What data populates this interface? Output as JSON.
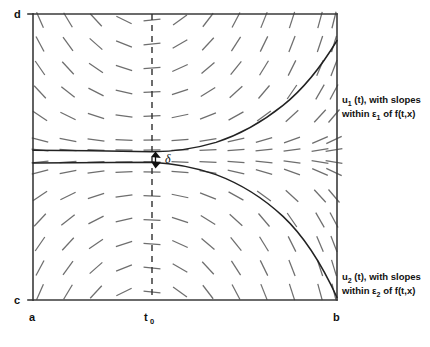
{
  "figure": {
    "axis_labels": {
      "top_left": "d",
      "bottom_left_inner": "c",
      "bottom_left_outer": "a",
      "bottom_right": "b",
      "t0_main": "t",
      "t0_sub": "0"
    },
    "delta_label": "δ",
    "annotations": {
      "upper": {
        "line1_pre": "u",
        "line1_sub": "1",
        "line1_post": " (t), with slopes",
        "line2_pre": "within ε",
        "line2_sub": "1",
        "line2_post": " of f(t,x)"
      },
      "lower": {
        "line1_pre": "u",
        "line1_sub": "2",
        "line1_post": " (t), with slopes",
        "line2_pre": "within ε",
        "line2_sub": "2",
        "line2_post": " of f(t,x)"
      }
    },
    "colors": {
      "frame": "#3a3a3a",
      "curve": "#222222",
      "slope_tick": "#6e6e6e",
      "dashed": "#2e2e2e",
      "text": "#111111",
      "background": "#ffffff"
    }
  },
  "chart_data": {
    "type": "line",
    "xlabel": "t",
    "ylabel": "x",
    "grid": false,
    "legend_position": "right",
    "axis_box": {
      "x_left_px": 33,
      "x_right_px": 337,
      "y_top_px": 14,
      "y_bottom_px": 300
    },
    "xlim": [
      "a",
      "b"
    ],
    "ylim": [
      "c",
      "d"
    ],
    "x_ticks": [
      "a",
      "t0",
      "b"
    ],
    "y_ticks": [
      "c",
      "d"
    ],
    "t0_px": 152,
    "midline_px": 156,
    "slope_field": {
      "description": "saddle-type direction field, slope proportional to (x - midline) * (t - t0)",
      "columns_px": [
        40,
        68,
        96,
        124,
        152,
        180,
        208,
        236,
        264,
        292,
        320,
        334
      ],
      "rows_px": [
        20,
        44,
        68,
        92,
        116,
        140,
        150,
        162,
        172,
        196,
        220,
        244,
        268,
        292
      ],
      "dash_length_px": 17
    },
    "series": [
      {
        "name": "u1(t)",
        "comment": "upper solution curve; flat near x=150 for t<t0, rises steeply toward d after t0",
        "points_px": [
          [
            33,
            150
          ],
          [
            60,
            150
          ],
          [
            90,
            150.5
          ],
          [
            120,
            151
          ],
          [
            152,
            152
          ],
          [
            180,
            151
          ],
          [
            205,
            147
          ],
          [
            230,
            139
          ],
          [
            255,
            127
          ],
          [
            280,
            110
          ],
          [
            300,
            92
          ],
          [
            318,
            70
          ],
          [
            330,
            50
          ],
          [
            337,
            38
          ]
        ]
      },
      {
        "name": "u2(t)",
        "comment": "lower solution curve; flat near x=163 for t<t0, falls steeply toward c after t0",
        "points_px": [
          [
            33,
            163
          ],
          [
            60,
            163
          ],
          [
            90,
            162.5
          ],
          [
            120,
            162
          ],
          [
            152,
            162
          ],
          [
            180,
            166
          ],
          [
            205,
            174
          ],
          [
            230,
            186
          ],
          [
            255,
            202
          ],
          [
            280,
            222
          ],
          [
            300,
            243
          ],
          [
            318,
            266
          ],
          [
            330,
            285
          ],
          [
            337,
            298
          ]
        ]
      }
    ],
    "annotations": [
      {
        "text": "δ",
        "at_px": [
          168,
          160
        ],
        "kind": "gap-measure",
        "between_series": [
          "u1(t)",
          "u2(t)"
        ]
      },
      {
        "text": "u1 (t), with slopes within ε1 of f(t,x)",
        "at_px": [
          342,
          100
        ]
      },
      {
        "text": "u2 (t), with slopes within ε2 of f(t,x)",
        "at_px": [
          342,
          277
        ]
      }
    ]
  }
}
